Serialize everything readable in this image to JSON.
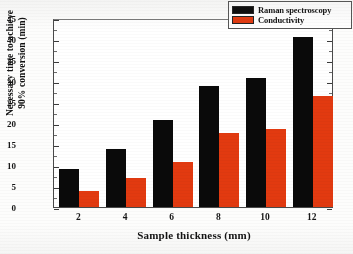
{
  "chart_data": {
    "type": "bar",
    "title": "",
    "xlabel": "Sample thickness (mm)",
    "ylabel_line1": "Necessary time to achieve",
    "ylabel_line2": "90% conversion (min)",
    "categories": [
      "2",
      "4",
      "6",
      "8",
      "10",
      "12"
    ],
    "series": [
      {
        "name": "Raman spectroscopy",
        "color": "#0a0a0a",
        "values": [
          9.0,
          13.8,
          20.7,
          28.7,
          30.6,
          40.5
        ]
      },
      {
        "name": "Conductivity",
        "color": "#e23a10",
        "values": [
          3.8,
          6.8,
          10.7,
          17.6,
          18.5,
          26.4
        ]
      }
    ],
    "ylim": [
      0,
      45
    ],
    "yticks": [
      "0",
      "5",
      "10",
      "15",
      "20",
      "25",
      "30",
      "35",
      "40",
      "45"
    ],
    "ytick_values": [
      0,
      5,
      10,
      15,
      20,
      25,
      30,
      35,
      40,
      45
    ],
    "xticks": [
      "2",
      "4",
      "6",
      "8",
      "10",
      "12"
    ],
    "grid": false,
    "legend_position": "top-right"
  },
  "legend": {
    "items": [
      {
        "label": "Raman spectroscopy",
        "color": "#0a0a0a"
      },
      {
        "label": "Conductivity",
        "color": "#e23a10"
      }
    ]
  }
}
